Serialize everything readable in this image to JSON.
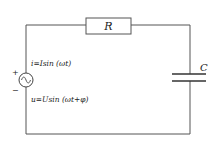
{
  "diagram": {
    "type": "RC series circuit",
    "components": {
      "resistor": {
        "label": "R"
      },
      "capacitor": {
        "label": "C"
      },
      "source": {
        "symbol": "AC voltage source",
        "plus_label": "+",
        "minus_label": "−",
        "current_eq": "i=Isin (ωt)",
        "voltage_eq": "u=Usin (ωt+φ)"
      }
    },
    "colors": {
      "wire": "#555555",
      "text": "#222222",
      "background": "#ffffff"
    }
  }
}
